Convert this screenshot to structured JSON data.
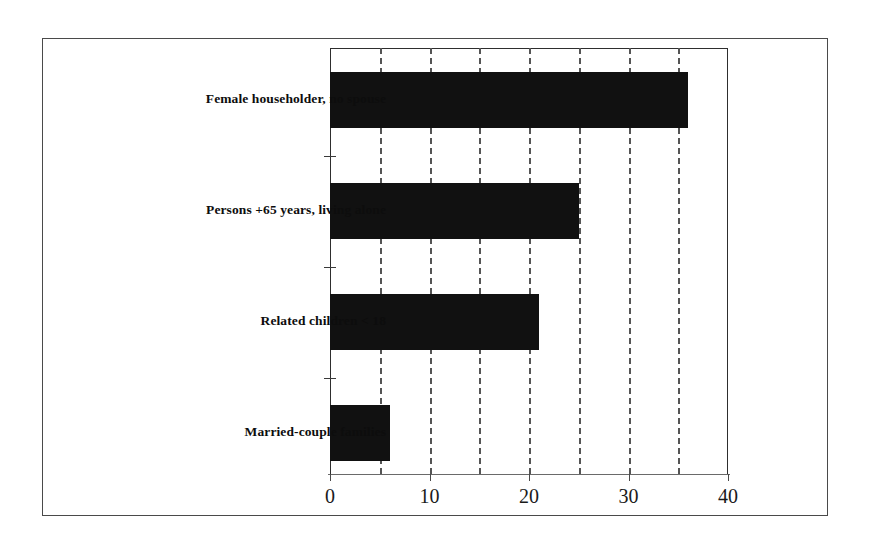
{
  "chart_data": {
    "type": "bar",
    "orientation": "horizontal",
    "title": "",
    "subtitle": "",
    "xlabel": "",
    "ylabel": "",
    "categories": [
      "Female householder, no spouse",
      "Persons +65 years, living alone",
      "Related children < 18",
      "Married-couple families"
    ],
    "values": [
      36,
      25,
      21,
      6
    ],
    "xlim": [
      0,
      40
    ],
    "xticks": [
      0,
      10,
      20,
      30,
      40
    ],
    "xtick_labels": [
      "0",
      "10",
      "20",
      "30",
      "40"
    ],
    "minor_gridlines": [
      5,
      10,
      15,
      20,
      25,
      30,
      35
    ],
    "grid": true,
    "grid_style": "dashed-vertical-minor",
    "legend": null,
    "legend_position": "none",
    "bar_color": "#111111",
    "axis_color": "#2e2e2e",
    "grid_color": "#555555",
    "background_color": "#ffffff"
  },
  "frame": {
    "border_color": "#4a4a4a"
  }
}
